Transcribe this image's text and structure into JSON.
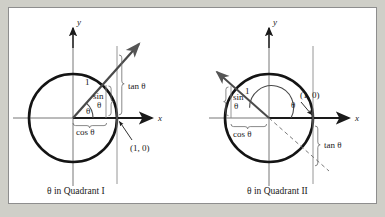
{
  "figure": {
    "background_color": "#cfcfc8",
    "panel_color": "#ffffff",
    "border_color": "#8e8e8e",
    "ink_color": "#1a1a1a",
    "gray_color": "#808080",
    "panels": [
      {
        "id": "quadrant-i",
        "caption": "θ in Quadrant I",
        "axis_x_label": "x",
        "axis_y_label": "y",
        "labels": {
          "radius": "1",
          "sin_top": "sin",
          "sin_bottom": "θ",
          "cos": "cos θ",
          "tan": "tan θ",
          "angle": "θ",
          "point": "(1, 0)"
        },
        "angle_degrees": 48,
        "terminal_side_direction": "upper-right",
        "tangent_side": "above-x-axis",
        "dashed_extension": false
      },
      {
        "id": "quadrant-ii",
        "caption": "θ in Quadrant II",
        "axis_x_label": "x",
        "axis_y_label": "y",
        "labels": {
          "radius": "1",
          "sin_top": "sin",
          "sin_bottom": "θ",
          "cos": "cos θ",
          "tan": "tan θ",
          "angle": "θ",
          "point": "(1, 0)"
        },
        "angle_degrees": 152,
        "terminal_side_direction": "upper-left",
        "tangent_side": "below-x-axis",
        "dashed_extension": true
      }
    ]
  }
}
